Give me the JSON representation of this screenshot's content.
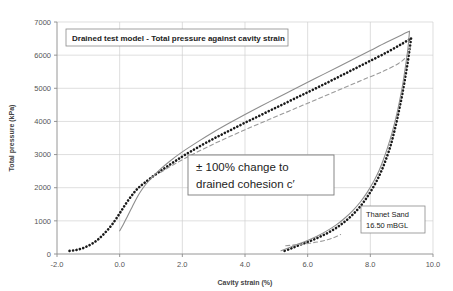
{
  "chart_data": {
    "type": "line",
    "title": "Drained test model - Total pressure against cavity strain",
    "xlabel": "Cavity strain (%)",
    "ylabel": "Total pressure (kPa)",
    "xlim": [
      -2.0,
      10.0
    ],
    "ylim": [
      0,
      7000
    ],
    "xticks": [
      "-2.0",
      "0.0",
      "2.0",
      "4.0",
      "6.0",
      "8.0",
      "10.0"
    ],
    "xtick_values": [
      -2.0,
      0.0,
      2.0,
      4.0,
      6.0,
      8.0,
      10.0
    ],
    "yticks": [
      "0",
      "1000",
      "2000",
      "3000",
      "4000",
      "5000",
      "6000",
      "7000"
    ],
    "ytick_values": [
      0,
      1000,
      2000,
      3000,
      4000,
      5000,
      6000,
      7000
    ],
    "grid": true,
    "legend_position": "none",
    "annotations": [
      {
        "name": "title-box",
        "text": "Drained test model - Total pressure against cavity strain"
      },
      {
        "name": "note-box",
        "line1": "± 100% change to",
        "line2": "drained cohesion c′"
      },
      {
        "name": "corner-box",
        "line1": "Thanet Sand",
        "line2": "16.50 mBGL"
      }
    ],
    "series": [
      {
        "name": "measured-dotted-loading",
        "style": "dotted",
        "color": "#1a1a1a",
        "points": [
          [
            -1.6,
            95
          ],
          [
            -1.45,
            110
          ],
          [
            -1.3,
            140
          ],
          [
            -1.15,
            185
          ],
          [
            -1.0,
            250
          ],
          [
            -0.85,
            330
          ],
          [
            -0.7,
            430
          ],
          [
            -0.55,
            560
          ],
          [
            -0.4,
            710
          ],
          [
            -0.25,
            880
          ],
          [
            -0.1,
            1080
          ],
          [
            0.05,
            1300
          ],
          [
            0.2,
            1520
          ],
          [
            0.35,
            1720
          ],
          [
            0.5,
            1900
          ],
          [
            0.65,
            2040
          ],
          [
            0.8,
            2150
          ],
          [
            1.0,
            2300
          ],
          [
            1.25,
            2470
          ],
          [
            1.5,
            2630
          ],
          [
            1.8,
            2820
          ],
          [
            2.1,
            3000
          ],
          [
            2.5,
            3220
          ],
          [
            3.0,
            3480
          ],
          [
            3.5,
            3720
          ],
          [
            4.0,
            3960
          ],
          [
            4.5,
            4190
          ],
          [
            5.0,
            4420
          ],
          [
            5.5,
            4650
          ],
          [
            6.0,
            4880
          ],
          [
            6.5,
            5110
          ],
          [
            7.0,
            5350
          ],
          [
            7.5,
            5590
          ],
          [
            8.0,
            5830
          ],
          [
            8.5,
            6070
          ],
          [
            8.9,
            6280
          ],
          [
            9.15,
            6420
          ],
          [
            9.3,
            6500
          ]
        ]
      },
      {
        "name": "measured-dotted-unloading",
        "style": "dotted",
        "color": "#1a1a1a",
        "points": [
          [
            9.3,
            6500
          ],
          [
            9.25,
            6150
          ],
          [
            9.18,
            5700
          ],
          [
            9.1,
            5250
          ],
          [
            9.02,
            4820
          ],
          [
            8.93,
            4400
          ],
          [
            8.84,
            4000
          ],
          [
            8.74,
            3600
          ],
          [
            8.63,
            3220
          ],
          [
            8.5,
            2860
          ],
          [
            8.36,
            2520
          ],
          [
            8.2,
            2200
          ],
          [
            8.02,
            1900
          ],
          [
            7.82,
            1610
          ],
          [
            7.6,
            1350
          ],
          [
            7.35,
            1110
          ],
          [
            7.08,
            900
          ],
          [
            6.78,
            710
          ],
          [
            6.45,
            545
          ],
          [
            6.1,
            400
          ],
          [
            5.75,
            275
          ],
          [
            5.45,
            160
          ],
          [
            5.2,
            75
          ]
        ]
      },
      {
        "name": "model-solid-grey-loading",
        "style": "solid",
        "color": "#8d8d8d",
        "points": [
          [
            0.0,
            700
          ],
          [
            0.12,
            900
          ],
          [
            0.25,
            1140
          ],
          [
            0.4,
            1420
          ],
          [
            0.55,
            1700
          ],
          [
            0.7,
            1930
          ],
          [
            0.85,
            2120
          ],
          [
            1.05,
            2330
          ],
          [
            1.3,
            2560
          ],
          [
            1.6,
            2800
          ],
          [
            2.0,
            3080
          ],
          [
            2.5,
            3390
          ],
          [
            3.0,
            3680
          ],
          [
            3.5,
            3950
          ],
          [
            4.0,
            4210
          ],
          [
            4.5,
            4460
          ],
          [
            5.0,
            4700
          ],
          [
            5.5,
            4940
          ],
          [
            6.0,
            5180
          ],
          [
            6.5,
            5420
          ],
          [
            7.0,
            5660
          ],
          [
            7.5,
            5900
          ],
          [
            8.0,
            6140
          ],
          [
            8.5,
            6380
          ],
          [
            9.0,
            6610
          ],
          [
            9.25,
            6720
          ]
        ]
      },
      {
        "name": "model-solid-grey-unloading",
        "style": "solid",
        "color": "#8d8d8d",
        "points": [
          [
            9.25,
            6720
          ],
          [
            9.2,
            6200
          ],
          [
            9.12,
            5650
          ],
          [
            9.03,
            5100
          ],
          [
            8.93,
            4600
          ],
          [
            8.82,
            4120
          ],
          [
            8.7,
            3680
          ],
          [
            8.57,
            3270
          ],
          [
            8.43,
            2880
          ],
          [
            8.28,
            2520
          ],
          [
            8.1,
            2180
          ],
          [
            7.9,
            1860
          ],
          [
            7.68,
            1570
          ],
          [
            7.44,
            1310
          ],
          [
            7.18,
            1080
          ],
          [
            6.9,
            870
          ],
          [
            6.6,
            690
          ],
          [
            6.28,
            530
          ],
          [
            5.96,
            395
          ],
          [
            5.64,
            280
          ],
          [
            5.36,
            175
          ],
          [
            5.15,
            95
          ]
        ]
      },
      {
        "name": "model-dashed-grey-loading",
        "style": "dashed",
        "color": "#9a9a9a",
        "points": [
          [
            1.3,
            2460
          ],
          [
            1.8,
            2740
          ],
          [
            2.4,
            3040
          ],
          [
            3.0,
            3320
          ],
          [
            3.6,
            3580
          ],
          [
            4.2,
            3830
          ],
          [
            4.8,
            4070
          ],
          [
            5.4,
            4310
          ],
          [
            6.0,
            4550
          ],
          [
            6.6,
            4790
          ],
          [
            7.2,
            5030
          ],
          [
            7.8,
            5270
          ],
          [
            8.4,
            5510
          ],
          [
            8.9,
            5750
          ],
          [
            9.15,
            5960
          ],
          [
            9.28,
            6230
          ]
        ]
      },
      {
        "name": "model-dashed-grey-unloading",
        "style": "dashed",
        "color": "#9a9a9a",
        "points": [
          [
            5.3,
            250
          ],
          [
            5.6,
            275
          ],
          [
            5.95,
            310
          ],
          [
            6.3,
            360
          ],
          [
            6.6,
            420
          ],
          [
            6.85,
            500
          ],
          [
            7.05,
            590
          ]
        ]
      }
    ]
  }
}
